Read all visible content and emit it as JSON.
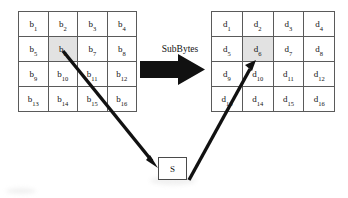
{
  "diagram": {
    "colors": {
      "stroke": "#5a5a5a",
      "arrow": "#111111",
      "highlight": "#e2e2e2",
      "text": "#111111",
      "background": "#ffffff"
    },
    "transform_label": "SubBytes",
    "sbox_label": "S",
    "input_grid": {
      "name": "input-state",
      "rows": 4,
      "cols": 4,
      "highlight_index": 5,
      "cells": [
        {
          "base": "b",
          "sub": "1"
        },
        {
          "base": "b",
          "sub": "2"
        },
        {
          "base": "b",
          "sub": "3"
        },
        {
          "base": "b",
          "sub": "4"
        },
        {
          "base": "b",
          "sub": "5"
        },
        {
          "base": "b",
          "sub": "6"
        },
        {
          "base": "b",
          "sub": "7"
        },
        {
          "base": "b",
          "sub": "8"
        },
        {
          "base": "b",
          "sub": "9"
        },
        {
          "base": "b",
          "sub": "10"
        },
        {
          "base": "b",
          "sub": "11"
        },
        {
          "base": "b",
          "sub": "12"
        },
        {
          "base": "b",
          "sub": "13"
        },
        {
          "base": "b",
          "sub": "14"
        },
        {
          "base": "b",
          "sub": "15"
        },
        {
          "base": "b",
          "sub": "16"
        }
      ]
    },
    "output_grid": {
      "name": "output-state",
      "rows": 4,
      "cols": 4,
      "highlight_index": 5,
      "cells": [
        {
          "base": "d",
          "sub": "1"
        },
        {
          "base": "d",
          "sub": "2"
        },
        {
          "base": "d",
          "sub": "3"
        },
        {
          "base": "d",
          "sub": "4"
        },
        {
          "base": "d",
          "sub": "5"
        },
        {
          "base": "d",
          "sub": "6"
        },
        {
          "base": "d",
          "sub": "7"
        },
        {
          "base": "d",
          "sub": "8"
        },
        {
          "base": "d",
          "sub": "9"
        },
        {
          "base": "d",
          "sub": "10"
        },
        {
          "base": "d",
          "sub": "11"
        },
        {
          "base": "d",
          "sub": "12"
        },
        {
          "base": "d",
          "sub": "13"
        },
        {
          "base": "d",
          "sub": "14"
        },
        {
          "base": "d",
          "sub": "15"
        },
        {
          "base": "d",
          "sub": "16"
        }
      ]
    },
    "arrows": [
      {
        "name": "block-arrow-subbytes",
        "from": "input-state",
        "to": "output-state",
        "style": "block"
      },
      {
        "name": "arrow-b6-to-sbox",
        "from": "b6",
        "to": "S",
        "style": "line"
      },
      {
        "name": "arrow-sbox-to-d6",
        "from": "S",
        "to": "d6",
        "style": "line"
      }
    ]
  }
}
